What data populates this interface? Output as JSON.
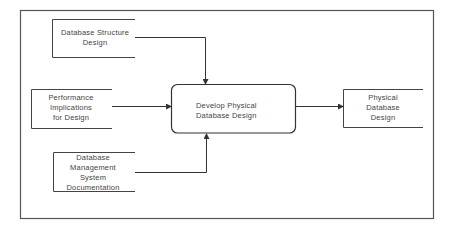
{
  "diagram": {
    "type": "data-flow",
    "inputs": [
      {
        "id": "db-structure",
        "lines": [
          "Database  Structure",
          "Design"
        ]
      },
      {
        "id": "performance",
        "lines": [
          "Performance",
          "Implications",
          "for Design"
        ]
      },
      {
        "id": "dbms-docs",
        "lines": [
          "Database",
          "Management",
          "System",
          "Documentation"
        ]
      }
    ],
    "process": {
      "id": "develop",
      "lines": [
        "Develop Physical",
        "Database Design"
      ]
    },
    "output": {
      "id": "physical-design",
      "lines": [
        "Physical",
        "Database",
        "Design"
      ]
    },
    "edges": [
      {
        "from": "db-structure",
        "to": "develop"
      },
      {
        "from": "performance",
        "to": "develop"
      },
      {
        "from": "dbms-docs",
        "to": "develop"
      },
      {
        "from": "develop",
        "to": "physical-design"
      }
    ],
    "colors": {
      "stroke": "#444444",
      "background": "#ffffff"
    }
  }
}
